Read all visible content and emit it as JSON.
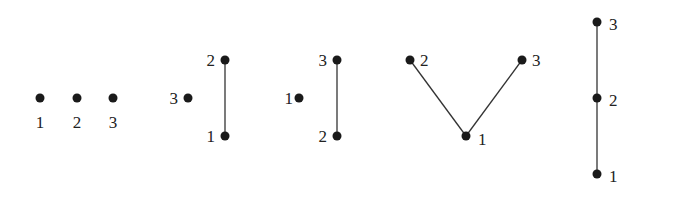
{
  "diagrams": [
    {
      "name": "antichain",
      "nodes": [
        {
          "id": "1",
          "label": "1"
        },
        {
          "id": "2",
          "label": "2"
        },
        {
          "id": "3",
          "label": "3"
        }
      ],
      "edges": []
    },
    {
      "name": "chain-1-2-plus-3",
      "nodes": [
        {
          "id": "3",
          "label": "3"
        },
        {
          "id": "2",
          "label": "2"
        },
        {
          "id": "1",
          "label": "1"
        }
      ],
      "edges": [
        [
          "1",
          "2"
        ]
      ]
    },
    {
      "name": "chain-2-3-plus-1",
      "nodes": [
        {
          "id": "1",
          "label": "1"
        },
        {
          "id": "3",
          "label": "3"
        },
        {
          "id": "2",
          "label": "2"
        }
      ],
      "edges": [
        [
          "2",
          "3"
        ]
      ]
    },
    {
      "name": "v-shape",
      "nodes": [
        {
          "id": "2",
          "label": "2"
        },
        {
          "id": "3",
          "label": "3"
        },
        {
          "id": "1",
          "label": "1"
        }
      ],
      "edges": [
        [
          "1",
          "2"
        ],
        [
          "1",
          "3"
        ]
      ]
    },
    {
      "name": "chain-1-2-3",
      "nodes": [
        {
          "id": "3",
          "label": "3"
        },
        {
          "id": "2",
          "label": "2"
        },
        {
          "id": "1",
          "label": "1"
        }
      ],
      "edges": [
        [
          "1",
          "2"
        ],
        [
          "2",
          "3"
        ]
      ]
    }
  ]
}
